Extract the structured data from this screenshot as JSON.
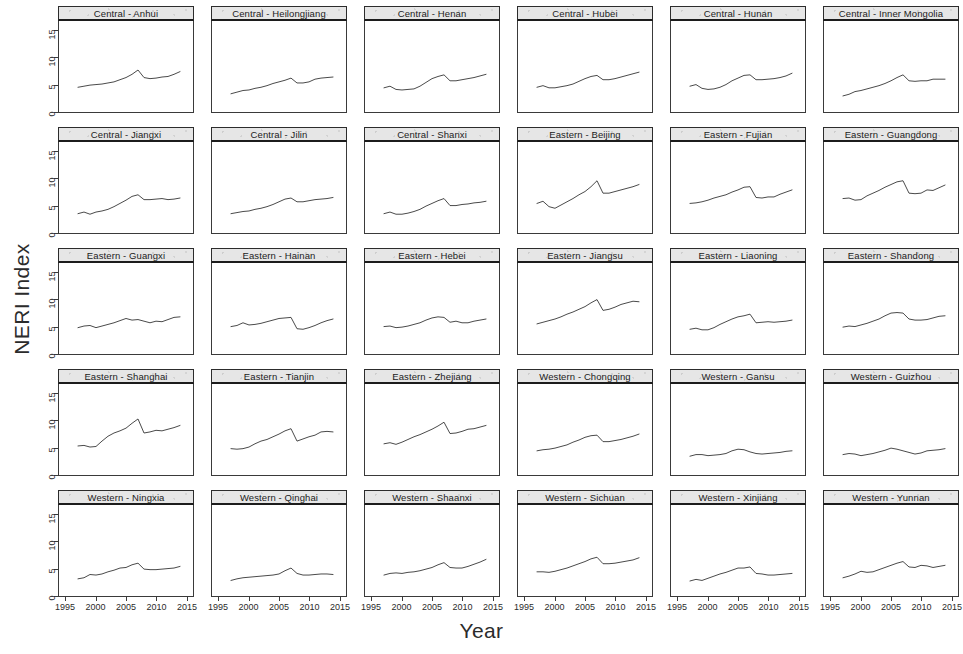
{
  "chart_data": {
    "type": "line",
    "title": "",
    "xlabel": "Year",
    "ylabel": "NERI Index",
    "grid": false,
    "legend": "none",
    "layout": {
      "rows": 5,
      "cols": 6,
      "panels": 30
    },
    "xlim": [
      1994,
      2016
    ],
    "ylim": [
      0,
      16.5
    ],
    "xticks": [
      1995,
      2000,
      2005,
      2010,
      2015
    ],
    "yticks": [
      0,
      5,
      10,
      15
    ],
    "x": [
      1997,
      1998,
      1999,
      2000,
      2001,
      2002,
      2003,
      2004,
      2005,
      2006,
      2007,
      2008,
      2009,
      2010,
      2011,
      2012,
      2013,
      2014
    ],
    "series": [
      {
        "name": "Central - Anhui",
        "region": "Central",
        "province": "Anhui",
        "values": [
          4.4,
          4.6,
          4.8,
          4.9,
          5.0,
          5.2,
          5.4,
          5.8,
          6.2,
          6.8,
          7.6,
          6.2,
          6.0,
          6.1,
          6.3,
          6.4,
          6.8,
          7.3
        ]
      },
      {
        "name": "Central - Heilongjiang",
        "region": "Central",
        "province": "Heilongjiang",
        "values": [
          3.2,
          3.5,
          3.8,
          3.9,
          4.2,
          4.4,
          4.7,
          5.1,
          5.4,
          5.7,
          6.1,
          5.2,
          5.2,
          5.4,
          5.9,
          6.1,
          6.2,
          6.3
        ]
      },
      {
        "name": "Central - Henan",
        "region": "Central",
        "province": "Henan",
        "values": [
          4.3,
          4.6,
          4.0,
          3.9,
          4.0,
          4.1,
          4.6,
          5.3,
          6.0,
          6.4,
          6.7,
          5.6,
          5.6,
          5.8,
          6.0,
          6.2,
          6.5,
          6.8
        ]
      },
      {
        "name": "Central - Hubei",
        "region": "Central",
        "province": "Hubei",
        "values": [
          4.4,
          4.7,
          4.3,
          4.3,
          4.5,
          4.7,
          5.0,
          5.5,
          6.0,
          6.4,
          6.6,
          5.8,
          5.8,
          6.0,
          6.3,
          6.6,
          6.9,
          7.2
        ]
      },
      {
        "name": "Central - Hunan",
        "region": "Central",
        "province": "Hunan",
        "values": [
          4.6,
          4.9,
          4.2,
          4.0,
          4.1,
          4.4,
          4.9,
          5.6,
          6.1,
          6.6,
          6.7,
          5.8,
          5.8,
          5.9,
          6.0,
          6.2,
          6.5,
          7.0
        ]
      },
      {
        "name": "Central - Inner Mongolia",
        "region": "Central",
        "province": "Inner Mongolia",
        "values": [
          2.8,
          3.1,
          3.6,
          3.8,
          4.1,
          4.4,
          4.7,
          5.1,
          5.6,
          6.2,
          6.7,
          5.6,
          5.5,
          5.6,
          5.6,
          5.9,
          5.9,
          5.9
        ]
      },
      {
        "name": "Central - Jiangxi",
        "region": "Central",
        "province": "Jiangxi",
        "values": [
          3.4,
          3.7,
          3.3,
          3.7,
          3.9,
          4.2,
          4.7,
          5.3,
          5.9,
          6.6,
          6.9,
          6.0,
          6.0,
          6.1,
          6.2,
          6.0,
          6.1,
          6.3
        ]
      },
      {
        "name": "Central - Jilin",
        "region": "Central",
        "province": "Jilin",
        "values": [
          3.4,
          3.6,
          3.8,
          3.9,
          4.2,
          4.4,
          4.7,
          5.1,
          5.6,
          6.1,
          6.3,
          5.6,
          5.6,
          5.8,
          6.0,
          6.1,
          6.2,
          6.4
        ]
      },
      {
        "name": "Central - Shanxi",
        "region": "Central",
        "province": "Shanxi",
        "values": [
          3.4,
          3.7,
          3.3,
          3.3,
          3.5,
          3.8,
          4.2,
          4.8,
          5.3,
          5.8,
          6.2,
          4.9,
          4.9,
          5.1,
          5.2,
          5.4,
          5.5,
          5.7
        ]
      },
      {
        "name": "Eastern - Beijing",
        "region": "Eastern",
        "province": "Beijing",
        "values": [
          5.3,
          5.7,
          4.7,
          4.4,
          5.0,
          5.6,
          6.2,
          6.9,
          7.5,
          8.4,
          9.5,
          7.2,
          7.2,
          7.5,
          7.8,
          8.1,
          8.4,
          8.8
        ]
      },
      {
        "name": "Eastern - Fujian",
        "region": "Eastern",
        "province": "Fujian",
        "values": [
          5.3,
          5.4,
          5.6,
          5.9,
          6.3,
          6.6,
          6.9,
          7.4,
          7.8,
          8.3,
          8.4,
          6.4,
          6.3,
          6.5,
          6.5,
          7.0,
          7.4,
          7.8
        ]
      },
      {
        "name": "Eastern - Guangdong",
        "region": "Eastern",
        "province": "Guangdong",
        "values": [
          6.2,
          6.3,
          5.9,
          6.0,
          6.7,
          7.2,
          7.7,
          8.3,
          8.8,
          9.3,
          9.5,
          7.2,
          7.1,
          7.2,
          7.8,
          7.7,
          8.2,
          8.7
        ]
      },
      {
        "name": "Eastern - Guangxi",
        "region": "Eastern",
        "province": "Guangxi",
        "values": [
          4.7,
          5.0,
          5.1,
          4.7,
          5.0,
          5.3,
          5.6,
          6.0,
          6.4,
          6.1,
          6.2,
          5.9,
          5.6,
          5.9,
          5.8,
          6.2,
          6.6,
          6.7
        ]
      },
      {
        "name": "Eastern - Hainan",
        "region": "Eastern",
        "province": "Hainan",
        "values": [
          4.9,
          5.1,
          5.6,
          5.2,
          5.3,
          5.5,
          5.8,
          6.1,
          6.4,
          6.5,
          6.6,
          4.5,
          4.4,
          4.7,
          5.1,
          5.6,
          6.0,
          6.3
        ]
      },
      {
        "name": "Eastern - Hebei",
        "region": "Eastern",
        "province": "Hebei",
        "values": [
          4.9,
          5.0,
          4.7,
          4.8,
          5.0,
          5.3,
          5.6,
          6.1,
          6.5,
          6.7,
          6.6,
          5.7,
          5.9,
          5.6,
          5.6,
          5.9,
          6.1,
          6.3
        ]
      },
      {
        "name": "Eastern - Jiangsu",
        "region": "Eastern",
        "province": "Jiangsu",
        "values": [
          5.4,
          5.7,
          6.0,
          6.3,
          6.7,
          7.2,
          7.6,
          8.1,
          8.6,
          9.3,
          9.9,
          7.9,
          8.1,
          8.5,
          9.0,
          9.3,
          9.6,
          9.5
        ]
      },
      {
        "name": "Eastern - Liaoning",
        "region": "Eastern",
        "province": "Liaoning",
        "values": [
          4.4,
          4.6,
          4.3,
          4.3,
          4.7,
          5.3,
          5.8,
          6.3,
          6.7,
          6.9,
          7.2,
          5.6,
          5.7,
          5.8,
          5.7,
          5.8,
          5.9,
          6.1
        ]
      },
      {
        "name": "Eastern - Shandong",
        "region": "Eastern",
        "province": "Shandong",
        "values": [
          4.8,
          5.0,
          4.9,
          5.2,
          5.5,
          5.9,
          6.3,
          6.9,
          7.4,
          7.5,
          7.4,
          6.3,
          6.1,
          6.1,
          6.2,
          6.5,
          6.8,
          6.9
        ]
      },
      {
        "name": "Eastern - Shanghai",
        "region": "Eastern",
        "province": "Shanghai",
        "values": [
          5.2,
          5.3,
          5.0,
          5.1,
          6.1,
          7.0,
          7.6,
          8.0,
          8.5,
          9.4,
          10.2,
          7.6,
          7.8,
          8.1,
          8.0,
          8.3,
          8.6,
          9.0
        ]
      },
      {
        "name": "Eastern - Tianjin",
        "region": "Eastern",
        "province": "Tianjin",
        "values": [
          4.7,
          4.6,
          4.7,
          5.0,
          5.6,
          6.1,
          6.4,
          6.9,
          7.4,
          8.0,
          8.4,
          6.1,
          6.5,
          6.9,
          7.2,
          7.8,
          7.9,
          7.8
        ]
      },
      {
        "name": "Eastern - Zhejiang",
        "region": "Eastern",
        "province": "Zhejiang",
        "values": [
          5.6,
          5.8,
          5.5,
          5.9,
          6.4,
          6.9,
          7.3,
          7.8,
          8.3,
          8.9,
          9.6,
          7.5,
          7.6,
          7.9,
          8.3,
          8.4,
          8.7,
          9.0
        ]
      },
      {
        "name": "Western - Chongqing",
        "region": "Western",
        "province": "Chongqing",
        "values": [
          4.3,
          4.5,
          4.6,
          4.8,
          5.1,
          5.4,
          5.9,
          6.3,
          6.8,
          7.1,
          7.2,
          6.0,
          6.0,
          6.2,
          6.4,
          6.7,
          7.0,
          7.4
        ]
      },
      {
        "name": "Western - Gansu",
        "region": "Western",
        "province": "Gansu",
        "values": [
          3.3,
          3.6,
          3.6,
          3.4,
          3.5,
          3.6,
          3.8,
          4.3,
          4.6,
          4.5,
          4.1,
          3.8,
          3.7,
          3.8,
          3.9,
          4.0,
          4.2,
          4.3
        ]
      },
      {
        "name": "Western - Guizhou",
        "region": "Western",
        "province": "Guizhou",
        "values": [
          3.6,
          3.8,
          3.7,
          3.4,
          3.6,
          3.8,
          4.1,
          4.4,
          4.8,
          4.6,
          4.3,
          4.0,
          3.7,
          3.9,
          4.3,
          4.4,
          4.5,
          4.7
        ]
      },
      {
        "name": "Western - Ningxia",
        "region": "Western",
        "province": "Ningxia",
        "values": [
          3.0,
          3.2,
          3.8,
          3.7,
          3.9,
          4.3,
          4.6,
          5.0,
          5.1,
          5.6,
          5.9,
          4.8,
          4.7,
          4.7,
          4.8,
          4.9,
          5.0,
          5.3
        ]
      },
      {
        "name": "Western - Qinghai",
        "region": "Western",
        "province": "Qinghai",
        "values": [
          2.7,
          3.0,
          3.2,
          3.3,
          3.4,
          3.5,
          3.6,
          3.7,
          3.9,
          4.5,
          5.0,
          4.0,
          3.7,
          3.7,
          3.8,
          3.9,
          3.9,
          3.8
        ]
      },
      {
        "name": "Western - Shaanxi",
        "region": "Western",
        "province": "Shaanxi",
        "values": [
          3.7,
          4.0,
          4.1,
          4.0,
          4.2,
          4.3,
          4.5,
          4.8,
          5.1,
          5.6,
          6.0,
          5.1,
          5.0,
          5.0,
          5.3,
          5.7,
          6.1,
          6.6
        ]
      },
      {
        "name": "Western - Sichuan",
        "region": "Western",
        "province": "Sichuan",
        "values": [
          4.3,
          4.3,
          4.2,
          4.4,
          4.7,
          5.0,
          5.4,
          5.8,
          6.2,
          6.7,
          7.0,
          5.8,
          5.8,
          5.9,
          6.1,
          6.3,
          6.5,
          6.9
        ]
      },
      {
        "name": "Western - Xinjiang",
        "region": "Western",
        "province": "Xinjiang",
        "values": [
          2.6,
          2.9,
          2.7,
          3.1,
          3.5,
          3.9,
          4.2,
          4.6,
          5.0,
          5.0,
          5.2,
          4.0,
          3.9,
          3.7,
          3.7,
          3.8,
          3.9,
          4.0
        ]
      },
      {
        "name": "Western - Yunnan",
        "region": "Western",
        "province": "Yunnan",
        "values": [
          3.2,
          3.5,
          3.9,
          4.4,
          4.2,
          4.3,
          4.7,
          5.1,
          5.5,
          5.9,
          6.2,
          5.2,
          5.1,
          5.5,
          5.4,
          5.1,
          5.3,
          5.5
        ]
      }
    ]
  },
  "axes": {
    "ylabel": "NERI Index",
    "xlabel": "Year",
    "yticks": [
      "0",
      "5",
      "10",
      "15"
    ],
    "xticks": [
      "1995",
      "2000",
      "2005",
      "2010",
      "2015"
    ]
  },
  "colors": {
    "line": "#333333",
    "strip_background": "#e6e6e6",
    "panel_border": "#3a3a3a",
    "text": "#1a1a1a"
  }
}
